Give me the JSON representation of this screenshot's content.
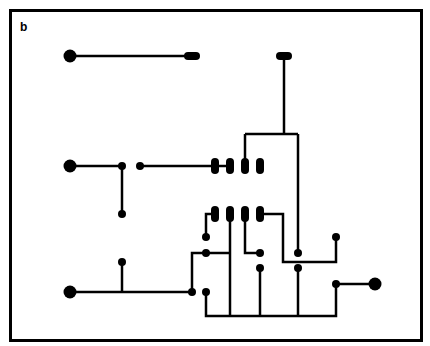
{
  "panel_label": "b",
  "colors": {
    "ink": "#000000",
    "background": "#ffffff"
  },
  "diagram": {
    "wires": [
      [
        [
          70,
          56
        ],
        [
          192,
          56
        ]
      ],
      [
        [
          70,
          166
        ],
        [
          122,
          166
        ]
      ],
      [
        [
          140,
          166
        ],
        [
          215,
          166
        ]
      ],
      [
        [
          122,
          166
        ],
        [
          122,
          214
        ]
      ],
      [
        [
          122,
          262
        ],
        [
          122,
          292
        ]
      ],
      [
        [
          70,
          292
        ],
        [
          192,
          292
        ]
      ],
      [
        [
          245,
          134
        ],
        [
          298,
          134
        ]
      ],
      [
        [
          284,
          60
        ],
        [
          284,
          134
        ]
      ],
      [
        [
          245,
          134
        ],
        [
          245,
          166
        ]
      ],
      [
        [
          298,
          134
        ],
        [
          298,
          253
        ]
      ],
      [
        [
          218,
          166
        ],
        [
          232,
          166
        ]
      ],
      [
        [
          206,
          237
        ],
        [
          206,
          214
        ],
        [
          214,
          214
        ]
      ],
      [
        [
          192,
          292
        ],
        [
          192,
          253
        ],
        [
          206,
          253
        ]
      ],
      [
        [
          206,
          253
        ],
        [
          230,
          253
        ]
      ],
      [
        [
          230,
          214
        ],
        [
          230,
          316
        ]
      ],
      [
        [
          245,
          214
        ],
        [
          245,
          253
        ],
        [
          260,
          253
        ]
      ],
      [
        [
          260,
          214
        ],
        [
          283,
          214
        ],
        [
          283,
          253
        ]
      ],
      [
        [
          260,
          268
        ],
        [
          260,
          316
        ]
      ],
      [
        [
          283,
          253
        ],
        [
          283,
          262
        ],
        [
          336,
          262
        ],
        [
          336,
          237
        ]
      ],
      [
        [
          298,
          268
        ],
        [
          298,
          316
        ]
      ],
      [
        [
          206,
          292
        ],
        [
          206,
          316
        ],
        [
          336,
          316
        ],
        [
          336,
          284
        ]
      ],
      [
        [
          336,
          284
        ],
        [
          375,
          284
        ]
      ]
    ],
    "pads_large": [
      [
        70,
        56
      ],
      [
        70,
        166
      ],
      [
        70,
        292
      ],
      [
        375,
        284
      ]
    ],
    "pads_oval_h": [
      [
        192,
        56
      ],
      [
        284,
        56
      ]
    ],
    "pads_oval_v": [
      [
        215,
        166
      ],
      [
        230,
        166
      ],
      [
        245,
        166
      ],
      [
        260,
        166
      ],
      [
        215,
        214
      ],
      [
        230,
        214
      ],
      [
        245,
        214
      ],
      [
        260,
        214
      ]
    ],
    "nodes": [
      [
        122,
        166
      ],
      [
        140,
        166
      ],
      [
        122,
        214
      ],
      [
        122,
        262
      ],
      [
        192,
        292
      ],
      [
        206,
        237
      ],
      [
        206,
        253
      ],
      [
        206,
        292
      ],
      [
        260,
        253
      ],
      [
        260,
        268
      ],
      [
        298,
        253
      ],
      [
        298,
        268
      ],
      [
        336,
        237
      ],
      [
        336,
        284
      ]
    ]
  }
}
